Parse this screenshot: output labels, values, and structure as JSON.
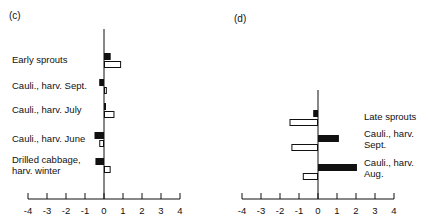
{
  "chart_data": [
    {
      "panel": "(c)",
      "type": "bar",
      "orientation": "horizontal",
      "title": "",
      "xlabel": "",
      "ylabel": "",
      "xlim": [
        -4,
        4
      ],
      "xticks": [
        -4,
        -3,
        -2,
        -1,
        0,
        1,
        2,
        3,
        4
      ],
      "grid": false,
      "legend": null,
      "categories": [
        "Early sprouts",
        "Cauli., harv. Sept.",
        "Cauli., harv. July",
        "Cauli., harv. June",
        "Drilled cabbage, harv. winter"
      ],
      "category_lines": [
        [
          "Early sprouts"
        ],
        [
          "Cauli., harv. Sept."
        ],
        [
          "Cauli., harv. July"
        ],
        [
          "Cauli., harv. June"
        ],
        [
          "Drilled cabbage,",
          "harv. winter"
        ]
      ],
      "label_side": "left",
      "series": [
        {
          "name": "filled",
          "fill": "#111111",
          "values": [
            0.35,
            -0.25,
            0.1,
            -0.5,
            -0.45
          ]
        },
        {
          "name": "open",
          "fill": "#ffffff",
          "values": [
            0.9,
            0.15,
            0.55,
            -0.25,
            0.35
          ]
        }
      ]
    },
    {
      "panel": "(d)",
      "type": "bar",
      "orientation": "horizontal",
      "title": "",
      "xlabel": "",
      "ylabel": "",
      "xlim": [
        -4,
        4
      ],
      "xticks": [
        -4,
        -3,
        -2,
        -1,
        0,
        1,
        2,
        3,
        4
      ],
      "grid": false,
      "legend": null,
      "categories": [
        "Late sprouts",
        "Cauli., harv. Sept.",
        "Cauli., harv. Aug."
      ],
      "category_lines": [
        [
          "Late sprouts"
        ],
        [
          "Cauli., harv.",
          "Sept."
        ],
        [
          "Cauli., harv.",
          "Aug."
        ]
      ],
      "label_side": "right",
      "series": [
        {
          "name": "filled",
          "fill": "#111111",
          "values": [
            -0.25,
            1.1,
            2.05
          ]
        },
        {
          "name": "open",
          "fill": "#ffffff",
          "values": [
            -1.5,
            -1.4,
            -0.8
          ]
        }
      ]
    }
  ],
  "panels": {
    "c": {
      "label": "(c)"
    },
    "d": {
      "label": "(d)"
    }
  },
  "colors": {
    "ink": "#111111",
    "background": "#ffffff"
  }
}
